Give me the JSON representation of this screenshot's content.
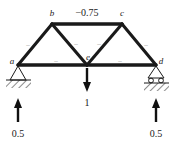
{
  "figure": {
    "type": "truss-free-body-diagram",
    "title": "",
    "background_color": "#ffffff",
    "line_color": "#1a1a1a"
  },
  "nodes": [
    {
      "id": "a",
      "label": "a",
      "x": 18,
      "y": 65,
      "support": "pin"
    },
    {
      "id": "b",
      "label": "b",
      "x": 52,
      "y": 24,
      "support": "none"
    },
    {
      "id": "c",
      "label": "c",
      "x": 122,
      "y": 24,
      "support": "none"
    },
    {
      "id": "d",
      "label": "d",
      "x": 156,
      "y": 65,
      "support": "roller"
    },
    {
      "id": "e",
      "label": "e",
      "x": 87,
      "y": 65,
      "support": "none"
    }
  ],
  "members": [
    {
      "id": "ab",
      "from": "a",
      "to": "b",
      "sign": "–",
      "force_label": ""
    },
    {
      "id": "bc",
      "from": "b",
      "to": "c",
      "sign": "",
      "force_label": "−0.75"
    },
    {
      "id": "cd",
      "from": "c",
      "to": "d",
      "sign": "–",
      "force_label": ""
    },
    {
      "id": "be",
      "from": "b",
      "to": "e",
      "sign": "–",
      "force_label": ""
    },
    {
      "id": "ce",
      "from": "c",
      "to": "e",
      "sign": "–",
      "force_label": ""
    },
    {
      "id": "ae",
      "from": "a",
      "to": "e",
      "sign": "–",
      "force_label": ""
    },
    {
      "id": "ed",
      "from": "e",
      "to": "d",
      "sign": "–",
      "force_label": ""
    }
  ],
  "loads": [
    {
      "id": "applied-load-e",
      "at_node": "e",
      "magnitude": "1",
      "direction": "down"
    }
  ],
  "reactions": [
    {
      "id": "reaction-a",
      "at_node": "a",
      "magnitude": "0.5",
      "direction": "up"
    },
    {
      "id": "reaction-d",
      "at_node": "d",
      "magnitude": "0.5",
      "direction": "up"
    }
  ],
  "supports": {
    "left": {
      "node": "a",
      "kind": "pin",
      "ground": "hatched"
    },
    "right": {
      "node": "d",
      "kind": "roller",
      "ground": "hatched",
      "roller_count": 2
    }
  },
  "top_chord_force": "−0.75"
}
